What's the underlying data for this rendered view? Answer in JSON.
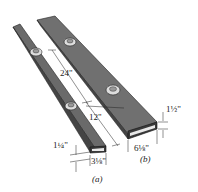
{
  "figure": {
    "dimensions": {
      "bolt_spacing_a": "24\"",
      "bolt_spacing_b": "12\"",
      "height_a": "1¼\"",
      "width_a": "3⅛\"",
      "height_b": "1½\"",
      "width_b": "6⅛\""
    },
    "captions": {
      "a": "(a)",
      "b": "(b)"
    },
    "colors": {
      "tube_top": "#6e6e6e",
      "tube_side": "#4a4a4a",
      "outline": "#1e1e1e",
      "background": "#ffffff"
    }
  }
}
